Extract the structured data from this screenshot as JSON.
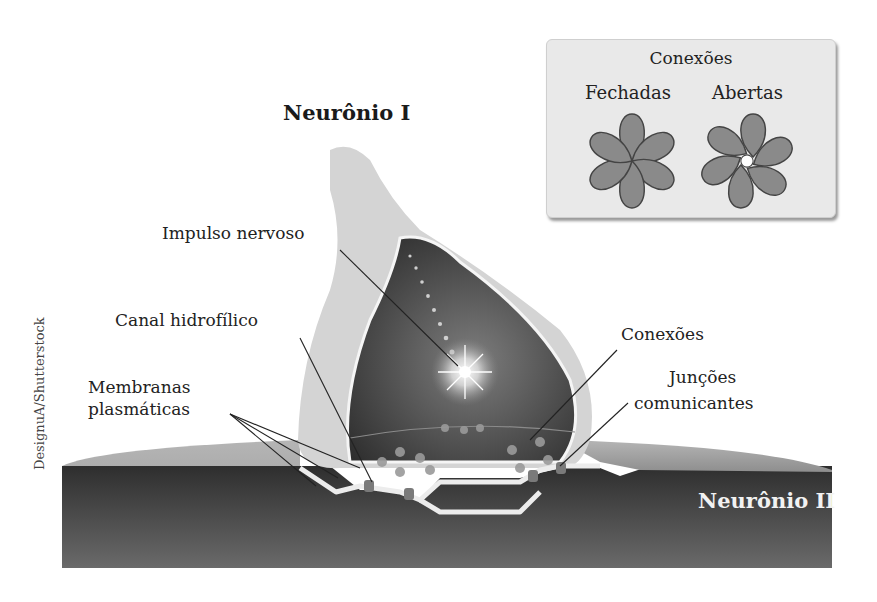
{
  "diagram": {
    "title_neuron_1": "Neurônio I",
    "title_neuron_2": "Neurônio II",
    "credit": "DesignuA/Shutterstock",
    "labels": {
      "impulse": "Impulso nervoso",
      "channel": "Canal hidrofílico",
      "membranes_line1": "Membranas",
      "membranes_line2": "plasmáticas",
      "connexons": "Conexões",
      "junctions_line1": "Junções",
      "junctions_line2": "comunicantes"
    },
    "legend": {
      "title": "Conexões",
      "closed": "Fechadas",
      "open": "Abertas",
      "icons": [
        "connexon-closed-icon",
        "connexon-open-icon"
      ]
    },
    "colors": {
      "neuron1_outer": "#d6d6d6",
      "neuron1_inner_dark": "#3a3a3a",
      "neuron2_top": "#9c9c9c",
      "neuron2_body": "#4a4a4a",
      "membrane": "#e8e8e8",
      "connexon": "#7a7a7a",
      "legend_bg": "#e9e9e9",
      "petal": "#8a8a8a"
    }
  }
}
